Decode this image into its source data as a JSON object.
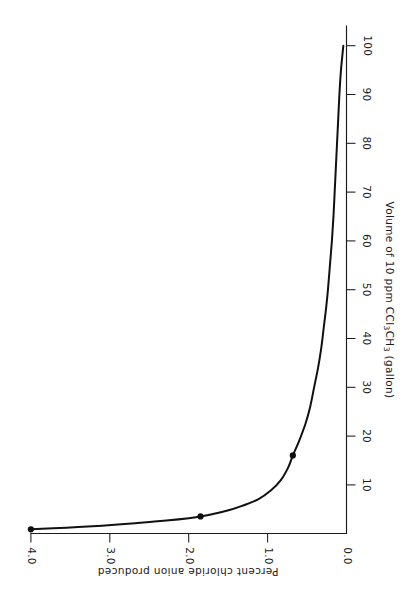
{
  "chart_data": {
    "type": "line",
    "title": "",
    "subtitle": "",
    "orientation": "rotated-90-clockwise",
    "xlabel": "Volume of 10 ppm CCl3CH3 (gallon)",
    "xlabel_parts": [
      {
        "text": "Volume of 10 ppm CCl",
        "sub": false
      },
      {
        "text": "3",
        "sub": true
      },
      {
        "text": "CH",
        "sub": false
      },
      {
        "text": "3",
        "sub": true
      },
      {
        "text": "  (gallon)",
        "sub": false
      }
    ],
    "ylabel": "Percent chloride anion produced",
    "xlim": [
      0,
      104
    ],
    "ylim": [
      0,
      4.35
    ],
    "xticks": [
      10,
      20,
      30,
      40,
      50,
      60,
      70,
      80,
      90,
      100
    ],
    "xticklabels": [
      "10",
      "20",
      "30",
      "40",
      "50",
      "60",
      "70",
      "80",
      "90",
      "100"
    ],
    "yticks": [
      0.0,
      1.0,
      2.0,
      3.0,
      4.0
    ],
    "yticklabels": [
      "0.0",
      "1.0",
      "2.0",
      "3.0",
      "4.0"
    ],
    "grid": false,
    "legend": false,
    "legend_position": "none",
    "series": [
      {
        "name": "Percent chloride anion produced",
        "marker": "filled-circle",
        "x": [
          0.85,
          1.2,
          1.6,
          2.1,
          2.7,
          3.5,
          4.4,
          5.5,
          7.0,
          8.8,
          11.0,
          13.5,
          16.0,
          19.0,
          22.5,
          26.0,
          30.0,
          34.0,
          38.0,
          42.0,
          46.0,
          50.0,
          55.0,
          60.0,
          65.0,
          70.0,
          75.0,
          80.0,
          85.0,
          90.0,
          95.0,
          100.0
        ],
        "y": [
          4.0,
          3.55,
          3.1,
          2.68,
          2.25,
          1.85,
          1.58,
          1.35,
          1.12,
          0.96,
          0.83,
          0.74,
          0.68,
          0.6,
          0.52,
          0.46,
          0.41,
          0.36,
          0.32,
          0.29,
          0.26,
          0.235,
          0.21,
          0.185,
          0.165,
          0.15,
          0.135,
          0.12,
          0.105,
          0.09,
          0.07,
          0.04
        ]
      }
    ],
    "data_points": [
      {
        "x": 0.85,
        "y": 4.0
      },
      {
        "x": 3.5,
        "y": 1.85
      },
      {
        "x": 16.0,
        "y": 0.68
      }
    ]
  },
  "axes": {
    "x_axis_name": "volume-axis",
    "y_axis_name": "percent-axis"
  }
}
